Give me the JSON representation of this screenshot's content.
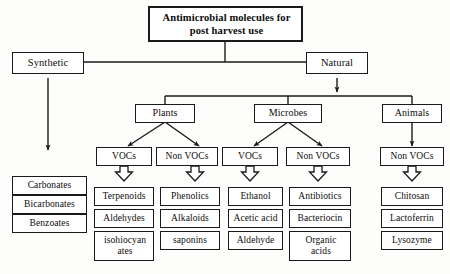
{
  "diagram": {
    "title": "Antimicrobial molecules for post harvest use",
    "title_line1": "Antimicrobial molecules for",
    "title_line2": "post harvest use",
    "type": "hierarchical-flowchart",
    "ink_color": "#1a1a1a",
    "background_color": "#fdfdfc",
    "level2": {
      "synthetic": "Synthetic",
      "natural": "Natural"
    },
    "level3": {
      "plants": "Plants",
      "microbes": "Microbes",
      "animals": "Animals"
    },
    "level4": {
      "plants_vocs": "VOCs",
      "plants_non_vocs": "Non VOCs",
      "microbes_vocs": "VOCs",
      "microbes_non_vocs": "Non VOCs",
      "animals_non_vocs": "Non VOCs"
    },
    "leaves": {
      "synthetic": [
        "Carbonates",
        "Bicarbonates",
        "Benzoates"
      ],
      "plants_vocs": [
        "Terpenoids",
        "Aldehydes",
        "isohiocyan ates"
      ],
      "plants_vocs_last_line1": "isohiocyan",
      "plants_vocs_last_line2": "ates",
      "plants_non_vocs": [
        "Phenolics",
        "Alkaloids",
        "saponins"
      ],
      "microbes_vocs": [
        "Ethanol",
        "Acetic acid",
        "Aldehyde"
      ],
      "microbes_non_vocs": [
        "Antibiotics",
        "Bacteriocin",
        "Organic acids"
      ],
      "microbes_non_vocs_last_line1": "Organic",
      "microbes_non_vocs_last_line2": "acids",
      "animals_non_vocs": [
        "Chitosan",
        "Lactoferrin",
        "Lysozyme"
      ]
    }
  }
}
